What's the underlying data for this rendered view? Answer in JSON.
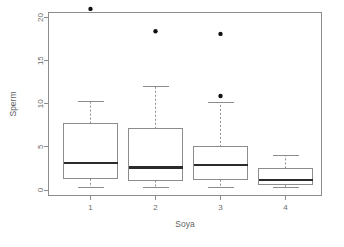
{
  "chart_data": {
    "type": "box",
    "title": "",
    "xlabel": "Soya",
    "ylabel": "Sperm",
    "categories": [
      "1",
      "2",
      "3",
      "4"
    ],
    "xtick_labels": [
      "1",
      "2",
      "3",
      "4"
    ],
    "ytick_labels": [
      "0",
      "5",
      "10",
      "15",
      "20"
    ],
    "ytick_values": [
      0,
      5,
      10,
      15,
      20
    ],
    "ylim": [
      -0.6,
      21.8
    ],
    "grid": false,
    "legend": "none",
    "boxes": [
      {
        "category": "1",
        "lower_whisker": 0.3,
        "q1": 1.3,
        "median": 3.1,
        "q3": 7.7,
        "upper_whisker": 10.3,
        "outliers": [
          21.0
        ]
      },
      {
        "category": "2",
        "lower_whisker": 0.3,
        "q1": 1.1,
        "median": 2.6,
        "q3": 7.1,
        "upper_whisker": 12.0,
        "outliers": [
          18.4
        ]
      },
      {
        "category": "3",
        "lower_whisker": 0.3,
        "q1": 1.2,
        "median": 2.9,
        "q3": 5.0,
        "upper_whisker": 10.1,
        "outliers": [
          10.9,
          18.1
        ]
      },
      {
        "category": "4",
        "lower_whisker": 0.3,
        "q1": 0.6,
        "median": 1.2,
        "q3": 2.5,
        "upper_whisker": 4.0,
        "outliers": []
      }
    ],
    "colors": {
      "box_fill": "#ffffff",
      "box_stroke": "#8c8c8c",
      "median": "#2b2b2b",
      "outlier": "#111111",
      "axis": "#8c8c8c",
      "text": "#6b6b6b",
      "background": "#ffffff"
    }
  },
  "axes": {
    "x_title": "Soya",
    "y_title": "Sperm"
  }
}
